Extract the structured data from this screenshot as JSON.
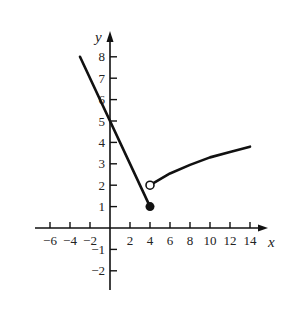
{
  "chart_data": {
    "type": "line",
    "title": "",
    "xlabel": "x",
    "ylabel": "y",
    "xlim": [
      -7,
      15.5
    ],
    "ylim": [
      -3,
      9
    ],
    "grid": false,
    "x_ticks": [
      -6,
      -4,
      -2,
      2,
      4,
      6,
      8,
      10,
      12,
      14
    ],
    "x_tick_labels": [
      "−6",
      "−4",
      "−2",
      "2",
      "4",
      "6",
      "8",
      "10",
      "12",
      "14"
    ],
    "y_ticks": [
      -2,
      -1,
      1,
      2,
      3,
      4,
      5,
      6,
      7,
      8
    ],
    "y_tick_labels": [
      "−2",
      "−1",
      "1",
      "2",
      "3",
      "4",
      "5",
      "6",
      "7",
      "8"
    ],
    "series": [
      {
        "name": "left piece (linear)",
        "points": [
          [
            -3,
            8
          ],
          [
            4,
            1
          ]
        ],
        "endpoints": [
          {
            "x": 4,
            "y": 1,
            "type": "closed"
          }
        ]
      },
      {
        "name": "right piece (curve)",
        "points": [
          [
            4,
            2
          ],
          [
            6,
            2.55
          ],
          [
            8,
            2.95
          ],
          [
            10,
            3.3
          ],
          [
            12,
            3.55
          ],
          [
            14,
            3.8
          ]
        ],
        "endpoints": [
          {
            "x": 4,
            "y": 2,
            "type": "open"
          }
        ]
      }
    ]
  }
}
